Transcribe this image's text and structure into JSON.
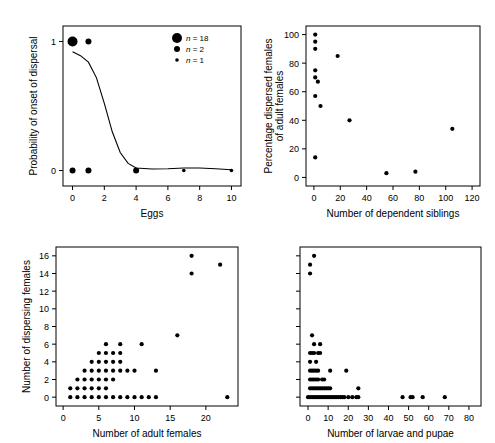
{
  "figure": {
    "background_color": "#ffffff",
    "point_color": "#000000",
    "axis_color": "#000000"
  },
  "chart_data": [
    {
      "id": "panel-a",
      "type": "scatter",
      "title": "",
      "xlabel": "Eggs",
      "ylabel": "Probability of onset of dispersal",
      "xlim": [
        -0.6,
        10.6
      ],
      "ylim": [
        -0.12,
        1.12
      ],
      "xticks": [
        0,
        2,
        4,
        6,
        8,
        10
      ],
      "yticks": [
        0,
        1
      ],
      "xticklabels": [
        "0",
        "2",
        "4",
        "6",
        "8",
        "10"
      ],
      "yticklabels": [
        "0",
        "1"
      ],
      "grid": false,
      "legend": {
        "position": "top-right",
        "entries": [
          {
            "label": "n = 18",
            "n": 18,
            "size": 18
          },
          {
            "label": "n = 2",
            "n": 2,
            "size": 2
          },
          {
            "label": "n = 1",
            "n": 1,
            "size": 1
          }
        ]
      },
      "points": [
        {
          "x": 0,
          "y": 1,
          "n": 18
        },
        {
          "x": 1,
          "y": 1,
          "n": 2
        },
        {
          "x": 0,
          "y": 0,
          "n": 2
        },
        {
          "x": 1,
          "y": 0,
          "n": 2
        },
        {
          "x": 4,
          "y": 0,
          "n": 2
        },
        {
          "x": 7,
          "y": 0,
          "n": 1
        },
        {
          "x": 10,
          "y": 0,
          "n": 1
        }
      ],
      "fit_curve": {
        "description": "logistic decline from ~0.92 at x=0 to ~0 by x=4",
        "x": [
          0,
          0.5,
          1.0,
          1.5,
          2.0,
          2.5,
          3.0,
          3.5,
          4.0,
          5.0,
          6.0,
          7.0,
          8.0,
          9.0,
          10.0
        ],
        "y": [
          0.92,
          0.89,
          0.84,
          0.72,
          0.52,
          0.3,
          0.14,
          0.055,
          0.02,
          0.012,
          0.014,
          0.02,
          0.02,
          0.014,
          0.006
        ]
      }
    },
    {
      "id": "panel-b",
      "type": "scatter",
      "title": "",
      "xlabel": "Number of dependent siblings",
      "ylabel": "Percentage dispersed females\nof adult females",
      "ylabel_line1": "Percentage dispersed females",
      "ylabel_line2": "of adult females",
      "xlim": [
        -6,
        126
      ],
      "ylim": [
        -6,
        106
      ],
      "xticks": [
        0,
        20,
        40,
        60,
        80,
        100,
        120
      ],
      "yticks": [
        0,
        20,
        40,
        60,
        80,
        100
      ],
      "xticklabels": [
        "0",
        "20",
        "40",
        "60",
        "80",
        "100",
        "120"
      ],
      "yticklabels": [
        "0",
        "20",
        "40",
        "60",
        "80",
        "100"
      ],
      "grid": false,
      "points": [
        {
          "x": 1,
          "y": 100
        },
        {
          "x": 1,
          "y": 95
        },
        {
          "x": 1,
          "y": 90
        },
        {
          "x": 18,
          "y": 85
        },
        {
          "x": 1,
          "y": 75
        },
        {
          "x": 1,
          "y": 70
        },
        {
          "x": 3,
          "y": 67
        },
        {
          "x": 1,
          "y": 57
        },
        {
          "x": 5,
          "y": 50
        },
        {
          "x": 27,
          "y": 40
        },
        {
          "x": 105,
          "y": 34
        },
        {
          "x": 1,
          "y": 14
        },
        {
          "x": 55,
          "y": 3
        },
        {
          "x": 77,
          "y": 4
        }
      ]
    },
    {
      "id": "panel-c",
      "type": "scatter",
      "title": "",
      "xlabel": "Number of adult females",
      "ylabel": "Number of dispersing females",
      "xlim": [
        -1,
        24.5
      ],
      "ylim": [
        -1,
        17
      ],
      "xticks": [
        0,
        5,
        10,
        15,
        20
      ],
      "yticks": [
        0,
        2,
        4,
        6,
        8,
        10,
        12,
        14,
        16
      ],
      "xticklabels": [
        "0",
        "5",
        "10",
        "15",
        "20"
      ],
      "yticklabels": [
        "0",
        "2",
        "4",
        "6",
        "8",
        "10",
        "12",
        "14",
        "16"
      ],
      "grid": false,
      "points": [
        {
          "x": 1,
          "y": 0
        },
        {
          "x": 2,
          "y": 0
        },
        {
          "x": 3,
          "y": 0
        },
        {
          "x": 4,
          "y": 0
        },
        {
          "x": 5,
          "y": 0
        },
        {
          "x": 6,
          "y": 0
        },
        {
          "x": 7,
          "y": 0
        },
        {
          "x": 8,
          "y": 0
        },
        {
          "x": 9,
          "y": 0
        },
        {
          "x": 10,
          "y": 0
        },
        {
          "x": 11,
          "y": 0
        },
        {
          "x": 12,
          "y": 0
        },
        {
          "x": 13,
          "y": 0
        },
        {
          "x": 23,
          "y": 0
        },
        {
          "x": 1,
          "y": 1
        },
        {
          "x": 2,
          "y": 1
        },
        {
          "x": 3,
          "y": 1
        },
        {
          "x": 4,
          "y": 1
        },
        {
          "x": 5,
          "y": 1
        },
        {
          "x": 6,
          "y": 1
        },
        {
          "x": 2,
          "y": 2
        },
        {
          "x": 3,
          "y": 2
        },
        {
          "x": 4,
          "y": 2
        },
        {
          "x": 5,
          "y": 2
        },
        {
          "x": 6,
          "y": 2
        },
        {
          "x": 7,
          "y": 2
        },
        {
          "x": 3,
          "y": 3
        },
        {
          "x": 4,
          "y": 3
        },
        {
          "x": 5,
          "y": 3
        },
        {
          "x": 6,
          "y": 3
        },
        {
          "x": 7,
          "y": 3
        },
        {
          "x": 8,
          "y": 3
        },
        {
          "x": 9,
          "y": 3
        },
        {
          "x": 10,
          "y": 3
        },
        {
          "x": 13,
          "y": 3
        },
        {
          "x": 4,
          "y": 4
        },
        {
          "x": 5,
          "y": 4
        },
        {
          "x": 6,
          "y": 4
        },
        {
          "x": 7,
          "y": 4
        },
        {
          "x": 8,
          "y": 4
        },
        {
          "x": 5,
          "y": 5
        },
        {
          "x": 6,
          "y": 5
        },
        {
          "x": 7,
          "y": 5
        },
        {
          "x": 8,
          "y": 5
        },
        {
          "x": 6,
          "y": 6
        },
        {
          "x": 8,
          "y": 6
        },
        {
          "x": 11,
          "y": 6
        },
        {
          "x": 16,
          "y": 7
        },
        {
          "x": 18,
          "y": 14
        },
        {
          "x": 22,
          "y": 15
        },
        {
          "x": 18,
          "y": 16
        }
      ]
    },
    {
      "id": "panel-d",
      "type": "scatter",
      "title": "",
      "xlabel": "Number of larvae and pupae",
      "ylabel": "",
      "xlim": [
        -4,
        86
      ],
      "ylim": [
        -1,
        17
      ],
      "xticks": [
        0,
        10,
        20,
        30,
        40,
        50,
        60,
        70,
        80
      ],
      "yticks": [
        0,
        2,
        4,
        6,
        8,
        10,
        12,
        14,
        16
      ],
      "xticklabels": [
        "0",
        "10",
        "20",
        "30",
        "40",
        "50",
        "60",
        "70",
        "80"
      ],
      "yticklabels": [],
      "grid": false,
      "points": [
        {
          "x": 0,
          "y": 0
        },
        {
          "x": 1,
          "y": 0
        },
        {
          "x": 2,
          "y": 0
        },
        {
          "x": 3,
          "y": 0
        },
        {
          "x": 4,
          "y": 0
        },
        {
          "x": 5,
          "y": 0
        },
        {
          "x": 6,
          "y": 0
        },
        {
          "x": 7,
          "y": 0
        },
        {
          "x": 8,
          "y": 0
        },
        {
          "x": 9,
          "y": 0
        },
        {
          "x": 10,
          "y": 0
        },
        {
          "x": 11,
          "y": 0
        },
        {
          "x": 12,
          "y": 0
        },
        {
          "x": 13,
          "y": 0
        },
        {
          "x": 14,
          "y": 0
        },
        {
          "x": 15,
          "y": 0
        },
        {
          "x": 16,
          "y": 0
        },
        {
          "x": 17,
          "y": 0
        },
        {
          "x": 18,
          "y": 0
        },
        {
          "x": 20,
          "y": 0
        },
        {
          "x": 22,
          "y": 0
        },
        {
          "x": 24,
          "y": 0
        },
        {
          "x": 25,
          "y": 0
        },
        {
          "x": 47,
          "y": 0
        },
        {
          "x": 51,
          "y": 0
        },
        {
          "x": 52,
          "y": 0
        },
        {
          "x": 57,
          "y": 0
        },
        {
          "x": 68,
          "y": 0
        },
        {
          "x": 1,
          "y": 1
        },
        {
          "x": 2,
          "y": 1
        },
        {
          "x": 3,
          "y": 1
        },
        {
          "x": 4,
          "y": 1
        },
        {
          "x": 5,
          "y": 1
        },
        {
          "x": 6,
          "y": 1
        },
        {
          "x": 7,
          "y": 1
        },
        {
          "x": 8,
          "y": 1
        },
        {
          "x": 9,
          "y": 1
        },
        {
          "x": 10,
          "y": 1
        },
        {
          "x": 11,
          "y": 1
        },
        {
          "x": 25,
          "y": 1
        },
        {
          "x": 1,
          "y": 2
        },
        {
          "x": 2,
          "y": 2
        },
        {
          "x": 3,
          "y": 2
        },
        {
          "x": 4,
          "y": 2
        },
        {
          "x": 5,
          "y": 2
        },
        {
          "x": 7,
          "y": 2
        },
        {
          "x": 8,
          "y": 2
        },
        {
          "x": 1,
          "y": 3
        },
        {
          "x": 2,
          "y": 3
        },
        {
          "x": 3,
          "y": 3
        },
        {
          "x": 4,
          "y": 3
        },
        {
          "x": 5,
          "y": 3
        },
        {
          "x": 11,
          "y": 3
        },
        {
          "x": 19,
          "y": 3
        },
        {
          "x": 1,
          "y": 4
        },
        {
          "x": 4,
          "y": 4
        },
        {
          "x": 1,
          "y": 5
        },
        {
          "x": 2,
          "y": 5
        },
        {
          "x": 3,
          "y": 5
        },
        {
          "x": 5,
          "y": 5
        },
        {
          "x": 6,
          "y": 5
        },
        {
          "x": 3,
          "y": 6
        },
        {
          "x": 6,
          "y": 6
        },
        {
          "x": 2,
          "y": 7
        },
        {
          "x": 1,
          "y": 14
        },
        {
          "x": 1,
          "y": 15
        },
        {
          "x": 3,
          "y": 16
        }
      ]
    }
  ]
}
